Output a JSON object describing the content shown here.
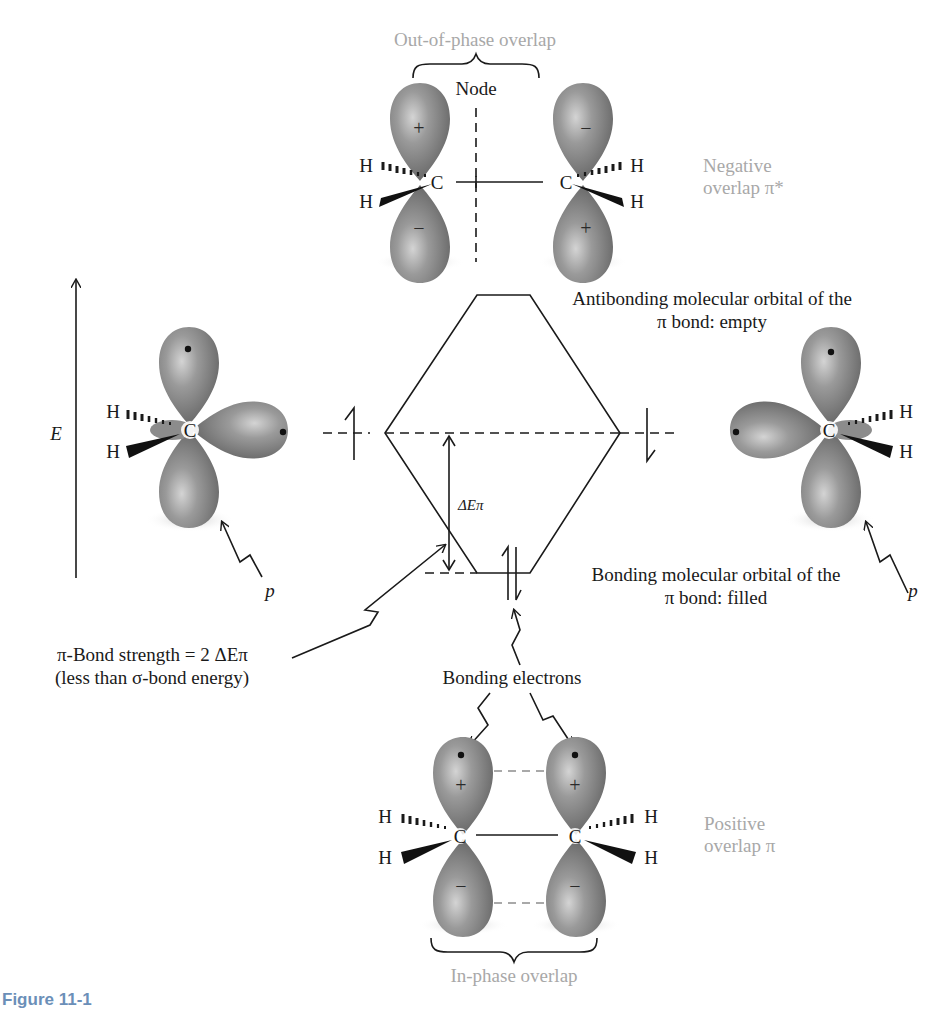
{
  "figure": {
    "top_orbital": {
      "brace_label": "Out-of-phase overlap",
      "node_label": "Node",
      "side_label_line1": "Negative",
      "side_label_line2": "overlap π*",
      "lobe_signs": {
        "left_top": "+",
        "left_bottom": "−",
        "right_top": "−",
        "right_bottom": "+"
      },
      "atoms": {
        "carbon": "C",
        "hydrogen": "H"
      }
    },
    "energy_axis": {
      "label": "E"
    },
    "left_p_orbital": {
      "atoms": {
        "carbon": "C",
        "hydrogen": "H"
      },
      "pointer_label": "p"
    },
    "right_p_orbital": {
      "atoms": {
        "carbon": "C",
        "hydrogen": "H"
      },
      "pointer_label": "p"
    },
    "antibonding_label_line1": "Antibonding molecular orbital of the",
    "antibonding_label_line2": "π bond: empty",
    "bonding_label_line1": "Bonding molecular orbital of the",
    "bonding_label_line2": "π bond: filled",
    "delta_e_label": "ΔEπ",
    "bond_strength_line1": "π-Bond strength = 2 ΔEπ",
    "bond_strength_line2": "(less than σ-bond energy)",
    "bonding_electrons_label": "Bonding electrons",
    "bottom_orbital": {
      "brace_label": "In-phase overlap",
      "side_label_line1": "Positive",
      "side_label_line2": "overlap π",
      "lobe_signs": {
        "left_top": "+",
        "left_bottom": "−",
        "right_top": "+",
        "right_bottom": "−"
      },
      "atoms": {
        "carbon": "C",
        "hydrogen": "H"
      }
    },
    "colors": {
      "lobe": "#8a8a8a",
      "lobe_highlight": "#c8c8c8",
      "ink": "#1a1a1a",
      "gray_label": "#a8a8a8",
      "caption_accent": "#6b8fb8"
    }
  },
  "caption": {
    "figure_number": "Figure 11-1",
    "text": "(caption text partially cropped at bottom edge; not fully legible)"
  }
}
